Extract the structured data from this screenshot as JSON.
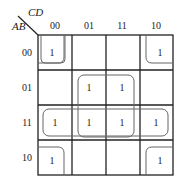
{
  "kmap": {
    "row_var": "AB",
    "col_var": "CD",
    "col_labels": [
      "00",
      "01",
      "11",
      "10"
    ],
    "row_labels": [
      "00",
      "01",
      "11",
      "10"
    ],
    "cells": [
      [
        "1",
        "",
        "",
        "1"
      ],
      [
        "",
        "1",
        "1",
        ""
      ],
      [
        "1",
        "1",
        "1",
        "1"
      ],
      [
        "1",
        "",
        "",
        "1"
      ]
    ],
    "groupings": [
      "corners (AB00/AB10 x CD00/CD10)",
      "center square (AB01/AB11 x CD01/CD11)",
      "row AB=11 (all four)"
    ]
  }
}
